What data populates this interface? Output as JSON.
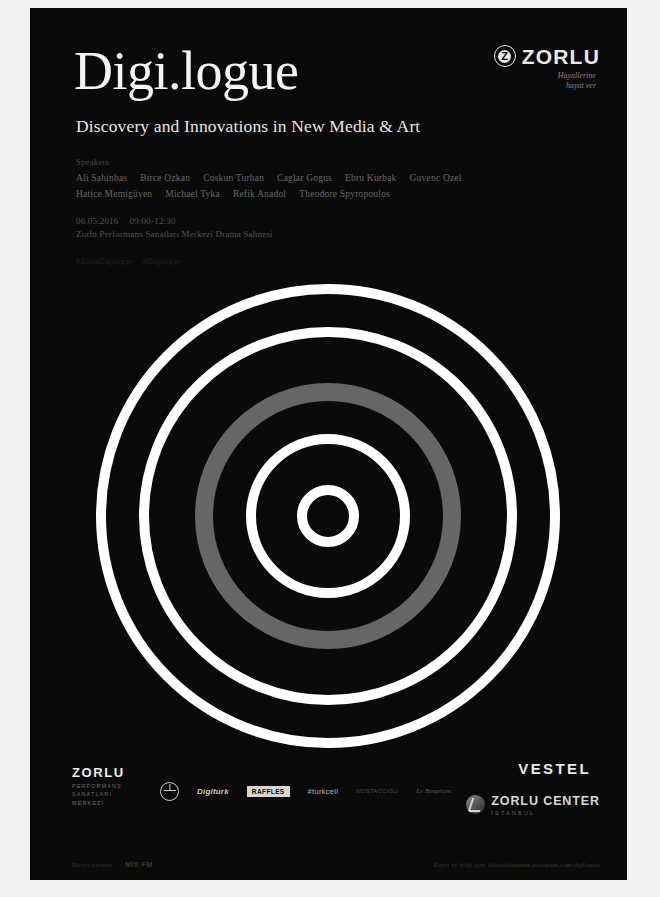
{
  "poster": {
    "background_color": "#0a0a0a",
    "page_color": "#f2f2f2",
    "title": "Digi.logue",
    "subtitle": "Discovery and Innovations in New Media & Art",
    "speakers_label": "Speakers",
    "speakers_row1": [
      "Ali Sahinbas",
      "Birce Ozkan",
      "Coskun Turhan",
      "Caglar Gogus",
      "Ebru Kurbak",
      "Guvenc Ozel"
    ],
    "speakers_row2": [
      "Hatice Memigüven",
      "Michael Tyka",
      "Refik Anadol",
      "Theodore Spyropoulos"
    ],
    "date": "06.05.2016",
    "time": "09:00-12:30",
    "venue": "Zorlu Performans Sanatları Merkezi Drama Sahnesi",
    "hashtags": [
      "#ZorluDigilogue",
      "#Digilogue"
    ]
  },
  "zorlu_logo": {
    "mark_glyph": "Z",
    "wordmark": "ZORLU",
    "tagline_line1": "Hayallerine",
    "tagline_line2": "hayat ver"
  },
  "footer": {
    "psm_wordmark": "ZORLU",
    "psm_sub_line1": "PERFORMANS",
    "psm_sub_line2": "SANATLARI",
    "psm_sub_line3": "MERKEZİ",
    "sponsors": [
      {
        "type": "mercedes",
        "name": "Mercedes-Benz"
      },
      {
        "type": "text",
        "name": "Digiturk"
      },
      {
        "type": "box",
        "name": "RAFFLES"
      },
      {
        "type": "plain",
        "name": "#turkcell"
      },
      {
        "type": "faint",
        "name": "MOSTACCIOLI"
      },
      {
        "type": "script",
        "name": "Le Bosphore"
      }
    ],
    "vestel": "VESTEL",
    "zorlu_center_name": "ZORLU CENTER",
    "zorlu_center_city": "İSTANBUL",
    "media_partners_label": "Medya partneri",
    "media_partner_name": "MİX FM",
    "registration_line": "Kayıt ve bilgi için: dijitaldonusum.zorlupsm.com/digilogue"
  },
  "graphic": {
    "type": "concentric-rings",
    "center_x": 298,
    "center_y": 508,
    "ring_white": "#ffffff",
    "ring_gray": "#666666",
    "rings": [
      {
        "radius": 232,
        "thickness": 10,
        "color": "#ffffff"
      },
      {
        "radius": 189,
        "thickness": 10,
        "color": "#ffffff"
      },
      {
        "radius": 133,
        "thickness": 18,
        "color": "#666666"
      },
      {
        "radius": 82,
        "thickness": 10,
        "color": "#ffffff"
      },
      {
        "radius": 31,
        "thickness": 10,
        "color": "#ffffff"
      }
    ]
  }
}
